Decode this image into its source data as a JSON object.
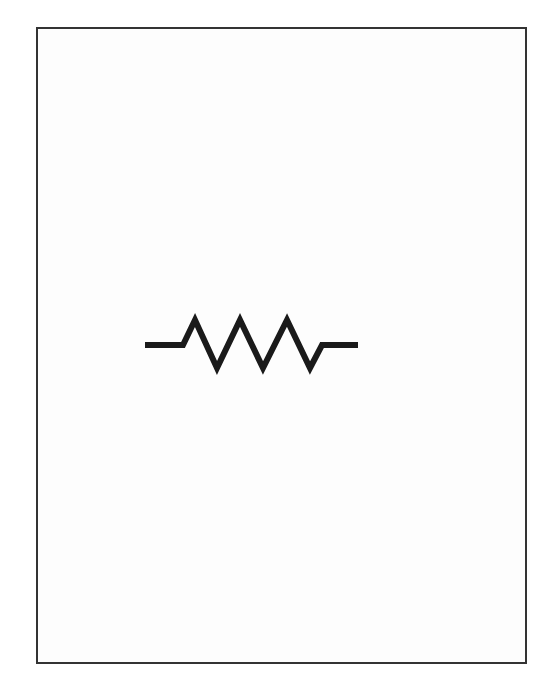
{
  "diagram": {
    "type": "circuit-symbol",
    "symbol": "resistor",
    "icon": "resistor-icon",
    "style": "zigzag",
    "peaks": 3,
    "stroke_color": "#1a1a1a",
    "frame_color": "#333333",
    "background": "#ffffff"
  }
}
